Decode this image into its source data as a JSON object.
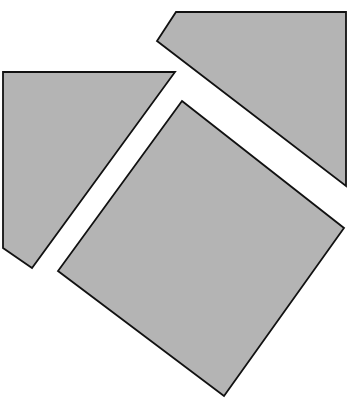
{
  "diagram": {
    "type": "geometric-dissection",
    "canvas": {
      "width": 350,
      "height": 406,
      "background": "#ffffff"
    },
    "fill_color": "#b4b4b4",
    "stroke_color": "#111111",
    "pieces": [
      {
        "id": "left-quadrilateral",
        "points": "3,72 175,72 32,268 3,248"
      },
      {
        "id": "top-right-quadrilateral",
        "points": "176,12 346,12 346,186 157,41"
      },
      {
        "id": "center-square",
        "points": "182,101 344,228 224,396 58,271"
      }
    ]
  }
}
